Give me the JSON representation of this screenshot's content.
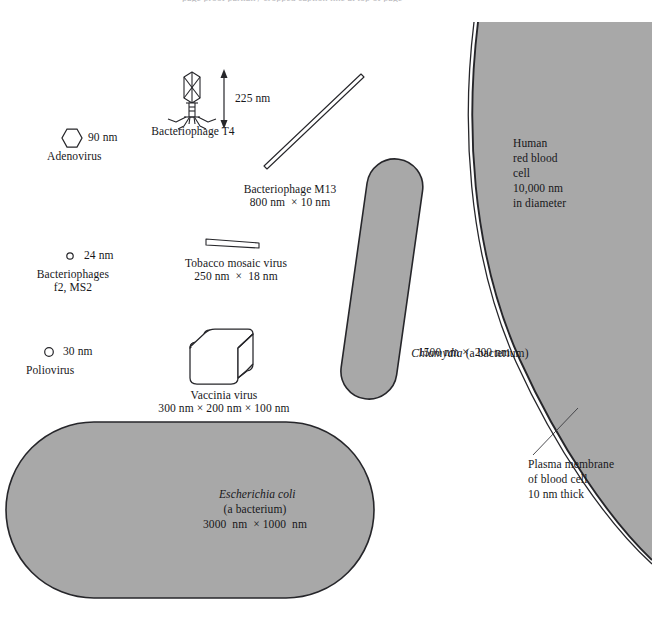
{
  "figure": {
    "title_cutoff": "page proof partially cropped caption line at top of page",
    "background_color": "#ffffff",
    "fill_gray": "#a8a8a8",
    "outline_color": "#26262a",
    "text_color": "#17171a"
  },
  "items": {
    "adenovirus": {
      "size": "90 nm",
      "name": "Adenovirus",
      "shape": "hexagon",
      "fill": "#ffffff"
    },
    "phage_t4": {
      "name": "Bacteriophage T4",
      "size": "225 nm",
      "shape": "bacteriophage",
      "fill": "#ffffff"
    },
    "phage_m13": {
      "name": "Bacteriophage M13",
      "size": "800 nm  × 10 nm",
      "shape": "thin-rod",
      "fill": "#ffffff"
    },
    "phages_f2_ms2": {
      "size": "24 nm",
      "name_line1": "Bacteriophages",
      "name_line2": "f2, MS2",
      "shape": "small-circle",
      "fill": "#ffffff"
    },
    "tobacco_mosaic_virus": {
      "name": "Tobacco mosaic virus",
      "size": "250 nm  ×  18 nm",
      "shape": "flat-rod",
      "fill": "#ffffff"
    },
    "poliovirus": {
      "size": "30 nm",
      "name": "Poliovirus",
      "shape": "small-circle",
      "fill": "#ffffff"
    },
    "vaccinia_virus": {
      "name": "Vaccinia virus",
      "size": "300 nm × 200 nm × 100 nm",
      "shape": "rounded-box-3d",
      "fill": "#ffffff"
    },
    "chlamydia": {
      "name_italic": "Chlamydia",
      "name_rest": " (a bacterium)",
      "size": "1500 nm ×  200 nm",
      "shape": "capsule-tilted",
      "fill": "#a8a8a8"
    },
    "escherichia_coli": {
      "name_italic": "Escherichia coli",
      "name_line2": "(a bacterium)",
      "size": "3000  nm  × 1000  nm",
      "shape": "capsule-large",
      "fill": "#a8a8a8"
    },
    "red_blood_cell": {
      "line1": "Human",
      "line2": "red blood",
      "line3": "cell",
      "line4": "10,000 nm",
      "line5": "in diameter",
      "shape": "large-arc",
      "fill": "#a8a8a8"
    },
    "plasma_membrane": {
      "line1": "Plasma membrane",
      "line2": "of blood cell",
      "line3": "10 nm thick",
      "shape": "double-line-edge"
    }
  }
}
